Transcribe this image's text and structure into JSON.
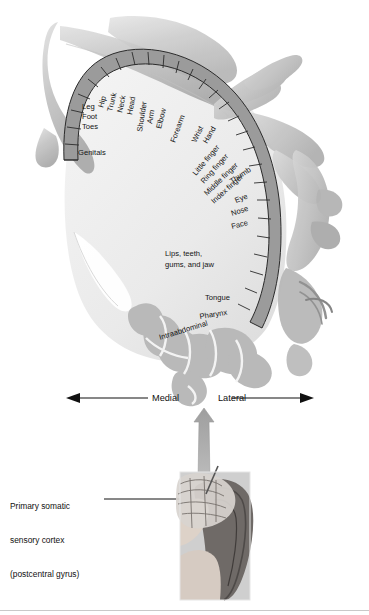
{
  "figure": {
    "type": "anatomical-diagram"
  },
  "cortex_labels": {
    "medial_group": [
      "Genitals",
      "Toes",
      "Foot",
      "Leg"
    ],
    "rotated_group": [
      "Hip",
      "Trunk",
      "Neck",
      "Head",
      "Shoulder",
      "Arm",
      "Elbow",
      "Forearm",
      "Wrist",
      "Hand",
      "Little finger",
      "Ring finger",
      "Middle finger",
      "Index finger",
      "Thumb"
    ],
    "lateral_group": [
      "Eye",
      "Nose",
      "Face"
    ],
    "mouth_block": "Lips, teeth,\ngums, and jaw",
    "lower_group": [
      "Tongue",
      "Pharynx",
      "Intraabdominal"
    ]
  },
  "axis": {
    "medial": "Medial",
    "lateral": "Lateral"
  },
  "caption": {
    "line1": "Primary somatic",
    "line2": "sensory cortex",
    "line3": "(postcentral gyrus)"
  },
  "inset": {
    "name": "head-profile-photo",
    "description": "Photograph of a woman's head in profile with a brain overlay"
  },
  "colors": {
    "strip_fill": "#9b9b9b",
    "strip_stroke": "#2a2a2a",
    "brain_interior": "#ededed",
    "gyri_gray": "#b9b9b9",
    "body_gray": "#c6c6c6",
    "arrow_gray": "#a8a8a8",
    "text": "#141414"
  }
}
